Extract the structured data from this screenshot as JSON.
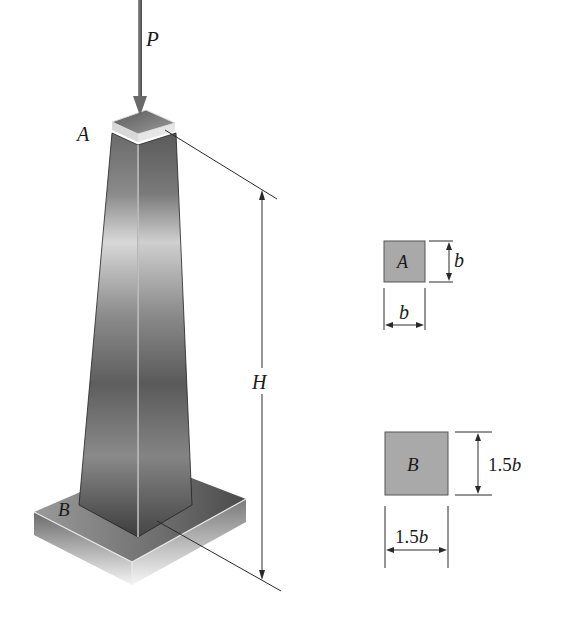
{
  "figure": {
    "load_label": "P",
    "top_label": "A",
    "bottom_label": "B",
    "height_label": "H"
  },
  "section_a": {
    "label": "A",
    "width_label": "b",
    "height_label": "b"
  },
  "section_b": {
    "label": "B",
    "width_num": "1.5",
    "width_var": "b",
    "height_num": "1.5",
    "height_var": "b"
  },
  "colors": {
    "section_fill": "#a9a9a9",
    "line": "#2a2a2a",
    "arrow": "#707070"
  }
}
